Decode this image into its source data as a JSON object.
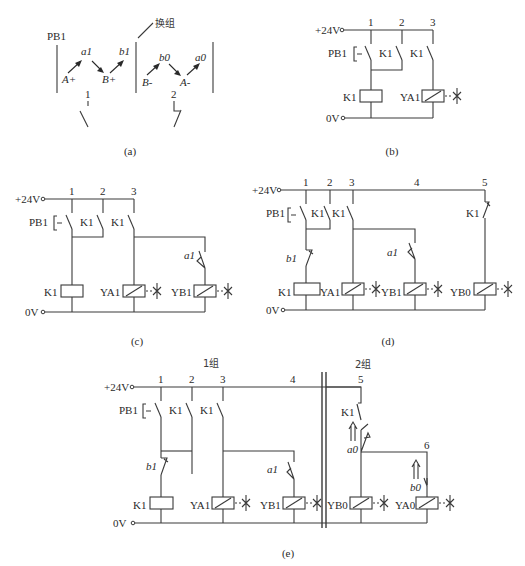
{
  "figure": {
    "a": {
      "caption": "(a)",
      "start_label": "PB1",
      "group_change_label": "换组",
      "group1_sequence": [
        "A+",
        "a1",
        "B+",
        "b1"
      ],
      "group2_sequence": [
        "B-",
        "b0",
        "A-",
        "a0"
      ],
      "line1_label": "1",
      "line2_label": "2"
    },
    "b": {
      "caption": "(b)",
      "supply_plus": "+24V",
      "supply_zero": "0V",
      "line_numbers": [
        "1",
        "2",
        "3"
      ],
      "contacts": [
        "PB1",
        "K1",
        "K1"
      ],
      "coils": [
        "K1",
        "YA1"
      ]
    },
    "c": {
      "caption": "(c)",
      "supply_plus": "+24V",
      "supply_zero": "0V",
      "line_numbers": [
        "1",
        "2",
        "3"
      ],
      "contacts": [
        "PB1",
        "K1",
        "K1",
        "a1"
      ],
      "coils": [
        "K1",
        "YA1",
        "YB1"
      ]
    },
    "d": {
      "caption": "(d)",
      "supply_plus": "+24V",
      "supply_zero": "0V",
      "line_numbers": [
        "1",
        "2",
        "3",
        "4",
        "5"
      ],
      "contacts": [
        "PB1",
        "K1",
        "K1",
        "b1",
        "a1",
        "K1"
      ],
      "coils": [
        "K1",
        "YA1",
        "YB1",
        "YB0"
      ]
    },
    "e": {
      "caption": "(e)",
      "supply_plus": "+24V",
      "supply_zero": "0V",
      "group1_label": "1组",
      "group2_label": "2组",
      "line_numbers": [
        "1",
        "2",
        "3",
        "4",
        "5",
        "6"
      ],
      "contacts": [
        "PB1",
        "K1",
        "K1",
        "b1",
        "a1",
        "K1",
        "a0",
        "b0"
      ],
      "coils": [
        "K1",
        "YA1",
        "YB1",
        "YB0",
        "YA0"
      ]
    }
  }
}
